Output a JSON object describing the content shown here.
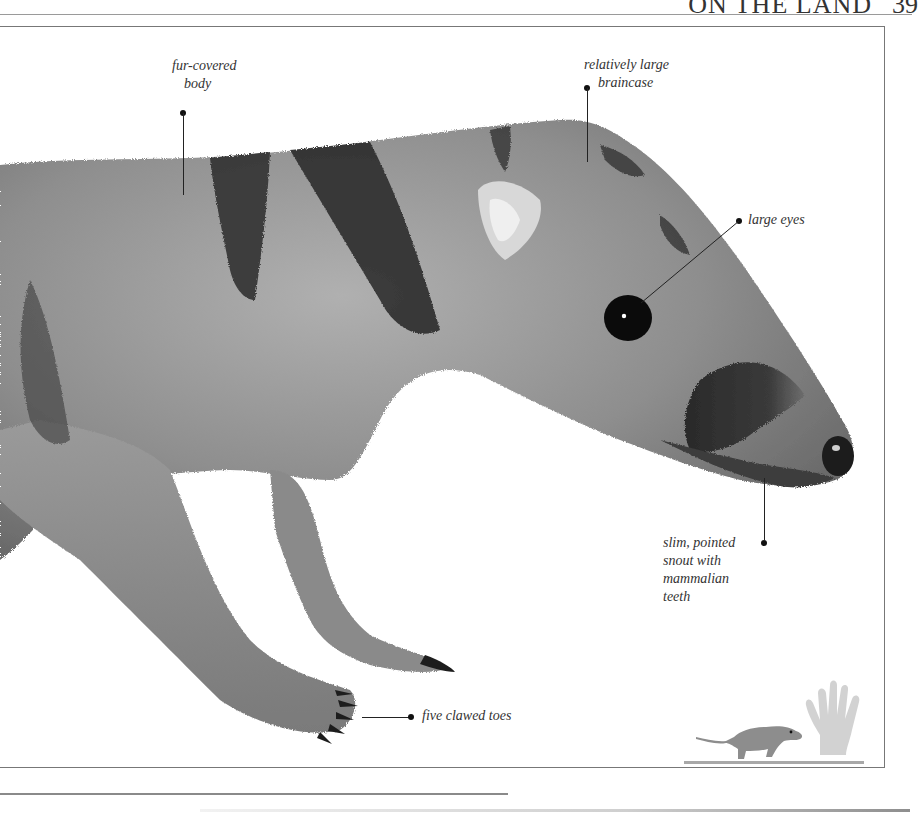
{
  "page": {
    "running_head": "ON THE LAND",
    "page_number": "39"
  },
  "specimen": {
    "subject": "small striped mammal",
    "fur_color": "#8f8f8f",
    "stripe_color": "#2a2a2a",
    "eye_color": "#0a0a0a",
    "nose_color": "#1a1a1a"
  },
  "callouts": [
    {
      "id": "fur",
      "lines": [
        "fur-covered",
        "body"
      ]
    },
    {
      "id": "braincase",
      "lines": [
        "relatively large",
        "braincase"
      ]
    },
    {
      "id": "eyes",
      "lines": [
        "large eyes"
      ]
    },
    {
      "id": "snout",
      "lines": [
        "slim, pointed",
        "snout with",
        "mammalian",
        "teeth"
      ]
    },
    {
      "id": "toes",
      "lines": [
        "five clawed toes"
      ]
    }
  ],
  "scale_figure": {
    "description": "size comparison: animal beside human hand",
    "ground_color": "#a8a8a8",
    "hand_color": "#cfcfcf"
  }
}
